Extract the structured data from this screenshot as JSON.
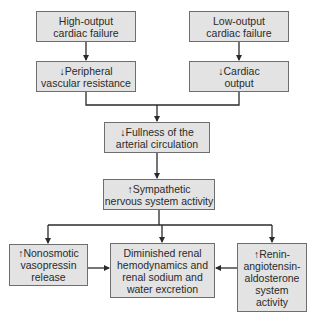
{
  "diagram": {
    "nodes": [
      {
        "id": "high_output",
        "lines": [
          "High-output",
          "cardiac failure"
        ]
      },
      {
        "id": "peripheral",
        "lines": [
          "↓Peripheral",
          "vascular resistance"
        ]
      },
      {
        "id": "low_output",
        "lines": [
          "Low-output",
          "cardiac failure"
        ]
      },
      {
        "id": "cardiac_output",
        "lines": [
          "↓Cardiac",
          "output"
        ]
      },
      {
        "id": "fullness",
        "lines": [
          "↓Fullness of the",
          "arterial circulation"
        ]
      },
      {
        "id": "sympathetic",
        "lines": [
          "↑Sympathetic",
          "nervous system activity"
        ]
      },
      {
        "id": "vasopressin",
        "lines": [
          "↑Nonosmotic",
          "vasopressin",
          "release"
        ]
      },
      {
        "id": "renal",
        "lines": [
          "Diminished renal",
          "hemodynamics and",
          "renal sodium and",
          "water excretion"
        ]
      },
      {
        "id": "raas",
        "lines": [
          "↑Renin-",
          "angiotensin-",
          "aldosterone",
          "system",
          "activity"
        ]
      }
    ],
    "edges": [
      {
        "from": "high_output",
        "to": "peripheral"
      },
      {
        "from": "low_output",
        "to": "cardiac_output"
      },
      {
        "from": "peripheral",
        "to": "fullness"
      },
      {
        "from": "cardiac_output",
        "to": "fullness"
      },
      {
        "from": "fullness",
        "to": "sympathetic"
      },
      {
        "from": "sympathetic",
        "to": "vasopressin"
      },
      {
        "from": "sympathetic",
        "to": "renal"
      },
      {
        "from": "sympathetic",
        "to": "raas"
      },
      {
        "from": "vasopressin",
        "to": "renal"
      },
      {
        "from": "raas",
        "to": "renal"
      }
    ],
    "colors": {
      "box_fill": "#e3e3e3",
      "box_border": "#6e6e6e",
      "line": "#2a2a2a"
    }
  }
}
